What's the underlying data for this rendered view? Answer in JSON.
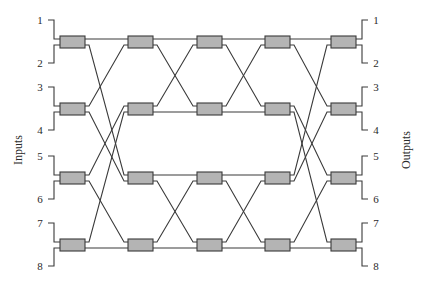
{
  "diagram": {
    "type": "benes-network",
    "stages": 5,
    "switches_per_stage": 4,
    "inputs_label": "Inputs",
    "outputs_label": "Outputs",
    "input_ports": [
      "1",
      "2",
      "3",
      "4",
      "5",
      "6",
      "7",
      "8"
    ],
    "output_ports": [
      "1",
      "2",
      "3",
      "4",
      "5",
      "6",
      "7",
      "8"
    ],
    "colors": {
      "switch_fill": "#b4b4b4",
      "line": "#3a3a3a",
      "background": "#ffffff"
    },
    "layout": {
      "column_x": [
        60,
        128,
        197,
        265,
        331
      ],
      "switch_width": 25,
      "switch_height": 12,
      "row_y": [
        42,
        109,
        178,
        245
      ],
      "port_offset": 3
    },
    "connections": [
      {
        "from_stage": 1,
        "map": [
          [
            0,
            0
          ],
          [
            1,
            4
          ],
          [
            2,
            1
          ],
          [
            3,
            5
          ],
          [
            4,
            2
          ],
          [
            5,
            6
          ],
          [
            6,
            3
          ],
          [
            7,
            7
          ]
        ]
      },
      {
        "from_stage": 2,
        "map": [
          [
            0,
            0
          ],
          [
            1,
            2
          ],
          [
            2,
            1
          ],
          [
            3,
            3
          ],
          [
            4,
            4
          ],
          [
            5,
            6
          ],
          [
            6,
            5
          ],
          [
            7,
            7
          ]
        ]
      },
      {
        "from_stage": 3,
        "map": [
          [
            0,
            0
          ],
          [
            1,
            2
          ],
          [
            2,
            1
          ],
          [
            3,
            3
          ],
          [
            4,
            4
          ],
          [
            5,
            6
          ],
          [
            6,
            5
          ],
          [
            7,
            7
          ]
        ]
      },
      {
        "from_stage": 4,
        "map": [
          [
            0,
            0
          ],
          [
            1,
            2
          ],
          [
            2,
            4
          ],
          [
            3,
            6
          ],
          [
            4,
            1
          ],
          [
            5,
            3
          ],
          [
            6,
            5
          ],
          [
            7,
            7
          ]
        ]
      }
    ]
  }
}
